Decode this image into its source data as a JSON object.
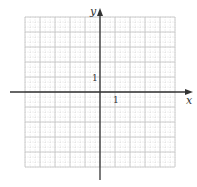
{
  "diagram": {
    "type": "coordinate-grid",
    "x_axis_label": "x",
    "y_axis_label": "y",
    "x_tick_label": "1",
    "y_tick_label": "1",
    "grid": {
      "x_min": -5,
      "x_max": 5,
      "y_min": -5,
      "y_max": 5,
      "major_step": 1,
      "minor_subdivisions": 3
    },
    "colors": {
      "axis": "#333333",
      "major_grid": "#c8c8c8",
      "minor_grid": "#d8d8d8",
      "background": "#ffffff"
    }
  }
}
